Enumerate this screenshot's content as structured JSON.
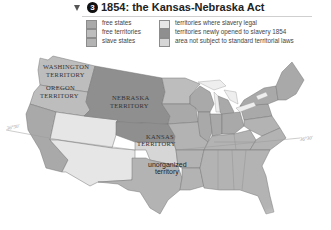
{
  "header": {
    "section_number": "3",
    "title": "1854: the Kansas-Nebraska Act"
  },
  "legend": {
    "items": [
      {
        "label": "free states",
        "color": "#a9a9a9"
      },
      {
        "label": "free territories",
        "color": "#bdbdbd"
      },
      {
        "label": "slave states",
        "color": "#b3b3b3"
      },
      {
        "label": "territories where slavery legal",
        "color": "#e6e6e6"
      },
      {
        "label": "territories newly opened to slavery 1854",
        "color": "#8f8f8f"
      },
      {
        "label": "area not subject to standard territorial laws",
        "color": "#d6d6d6"
      }
    ]
  },
  "map": {
    "regions": {
      "washington": "WASHINGTON TERRITORY",
      "oregon": "OREGON TERRITORY",
      "nebraska": "NEBRASKA TERRITORY",
      "kansas": "KANSAS TERRITORY",
      "unorganized": "unorganized territory"
    },
    "labels": {
      "washington_1": "WASHINGTON",
      "washington_2": "TERRITORY",
      "oregon_1": "OREGON",
      "oregon_2": "TERRITORY",
      "nebraska_1": "NEBRASKA",
      "nebraska_2": "TERRITORY",
      "kansas_1": "KANSAS",
      "kansas_2": "TERRITORY",
      "unorganized_1": "unorganized",
      "unorganized_2": "territory",
      "lat_west": "36°30'",
      "lat_east": "36°30'"
    },
    "colors": {
      "free_states": "#a9a9a9",
      "free_territories": "#bdbdbd",
      "slave_states": "#b3b3b3",
      "slavery_legal_territories": "#e6e6e6",
      "newly_opened": "#8f8f8f",
      "unorganized": "#d6d6d6",
      "border": "#6f6f6f"
    }
  }
}
